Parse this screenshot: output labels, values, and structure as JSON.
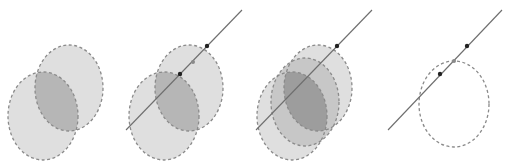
{
  "figure": {
    "width": 508,
    "height": 166,
    "background": "#ffffff",
    "stroke_color": "#8a8a8a",
    "line_color": "#6e6e6e",
    "dot_dark": "#222222",
    "dot_gray": "#8a8a8a",
    "fill_light": "#d9d9d9",
    "fill_overlap": "#a9a9a9"
  },
  "panels": [
    {
      "id": "panel-1",
      "ellipses": [
        {
          "cx": 69,
          "cy": 88,
          "rx": 34,
          "ry": 43,
          "fill": "#dcdcdc"
        },
        {
          "cx": 43,
          "cy": 116,
          "rx": 35,
          "ry": 44,
          "fill": "#dcdcdc"
        }
      ],
      "overlap": true,
      "line": null,
      "dots": []
    },
    {
      "id": "panel-2",
      "ellipses": [
        {
          "cx": 189,
          "cy": 88,
          "rx": 34,
          "ry": 43,
          "fill": "#dcdcdc"
        },
        {
          "cx": 164,
          "cy": 116,
          "rx": 35,
          "ry": 44,
          "fill": "#dcdcdc"
        }
      ],
      "overlap": true,
      "line": {
        "x1": 126,
        "y1": 130,
        "x2": 242,
        "y2": 10
      },
      "dots": [
        {
          "cx": 207,
          "cy": 46,
          "r": 2.2,
          "tone": "dark"
        },
        {
          "cx": 193,
          "cy": 62,
          "r": 2,
          "tone": "gray"
        },
        {
          "cx": 180,
          "cy": 74,
          "r": 2.2,
          "tone": "dark"
        }
      ]
    },
    {
      "id": "panel-3",
      "ellipses": [
        {
          "cx": 318,
          "cy": 88,
          "rx": 34,
          "ry": 43,
          "fill": "#dcdcdc"
        },
        {
          "cx": 292,
          "cy": 116,
          "rx": 35,
          "ry": 44,
          "fill": "#dcdcdc"
        },
        {
          "cx": 305,
          "cy": 102,
          "rx": 34,
          "ry": 44,
          "fill": "#c4c4c4"
        }
      ],
      "overlap": true,
      "line": {
        "x1": 256,
        "y1": 130,
        "x2": 372,
        "y2": 10
      },
      "dots": [
        {
          "cx": 337,
          "cy": 46,
          "r": 2.2,
          "tone": "dark"
        }
      ]
    },
    {
      "id": "panel-4",
      "ellipses": [
        {
          "cx": 454,
          "cy": 104,
          "rx": 35,
          "ry": 43,
          "fill": "none"
        }
      ],
      "overlap": false,
      "line": {
        "x1": 388,
        "y1": 130,
        "x2": 502,
        "y2": 10
      },
      "dots": [
        {
          "cx": 467,
          "cy": 46,
          "r": 2.2,
          "tone": "dark"
        },
        {
          "cx": 454,
          "cy": 61,
          "r": 2,
          "tone": "gray"
        },
        {
          "cx": 440,
          "cy": 74,
          "r": 2.2,
          "tone": "dark"
        }
      ]
    }
  ]
}
